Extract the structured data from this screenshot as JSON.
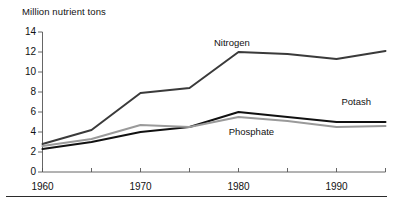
{
  "chart_data": {
    "type": "line",
    "title": "Million nutrient tons",
    "xlabel": "",
    "ylabel": "Million nutrient tons",
    "x": [
      1960,
      1965,
      1970,
      1975,
      1980,
      1985,
      1990,
      1995
    ],
    "xlim": [
      1960,
      1995
    ],
    "ylim": [
      0,
      14
    ],
    "grid": false,
    "legend_position": "inline-annotations",
    "y_ticks": [
      0,
      2,
      4,
      6,
      8,
      10,
      12,
      14
    ],
    "y_tick_labels": [
      "0",
      "2",
      "4",
      "6",
      "8",
      "10",
      "12",
      "14"
    ],
    "x_ticks": [
      1960,
      1965,
      1970,
      1975,
      1980,
      1985,
      1990,
      1995
    ],
    "x_tick_labels": [
      "1960",
      "",
      "1970",
      "",
      "1980",
      "",
      "1990",
      ""
    ],
    "x_labeled_ticks": [
      {
        "value": 1960,
        "label": "1960"
      },
      {
        "value": 1970,
        "label": "1970"
      },
      {
        "value": 1980,
        "label": "1980"
      },
      {
        "value": 1990,
        "label": "1990"
      }
    ],
    "series": [
      {
        "name": "Nitrogen",
        "color": "#3a3a3a",
        "width": 2.0,
        "values": [
          2.8,
          4.2,
          7.9,
          8.4,
          12.0,
          11.8,
          11.3,
          12.1
        ],
        "label_x": 1977.5,
        "label_y": 12.9
      },
      {
        "name": "Potash",
        "color": "#111111",
        "width": 2.0,
        "values": [
          2.3,
          3.0,
          4.0,
          4.5,
          6.0,
          5.5,
          5.0,
          5.0
        ],
        "label_x": 1990.5,
        "label_y": 7.0
      },
      {
        "name": "Phosphate",
        "color": "#9a9a9a",
        "width": 2.0,
        "values": [
          2.6,
          3.3,
          4.7,
          4.5,
          5.5,
          5.1,
          4.5,
          4.6
        ],
        "label_x": 1979.0,
        "label_y": 4.0
      }
    ]
  },
  "axis": {
    "title": "Million nutrient tons"
  }
}
